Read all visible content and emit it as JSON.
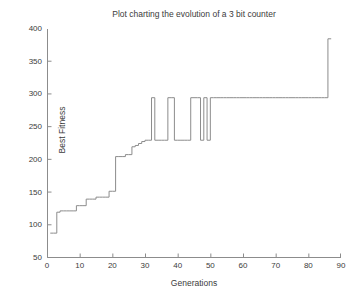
{
  "chart_data": {
    "type": "line",
    "title": "Plot charting the evolution of a 3 bit counter",
    "xlabel": "Generations",
    "ylabel": "Best Fitness",
    "xlim": [
      0,
      90
    ],
    "ylim": [
      50,
      400
    ],
    "xticks": [
      0,
      10,
      20,
      30,
      40,
      50,
      60,
      70,
      80,
      90
    ],
    "yticks": [
      50,
      100,
      150,
      200,
      250,
      300,
      350,
      400
    ],
    "grid": false,
    "legend": null,
    "line_color": "#8c8c8c",
    "background_color": "#ffffff",
    "drawstyle": "steps-post",
    "series": [
      {
        "name": "Best Fitness",
        "x": [
          1,
          2,
          3,
          4,
          5,
          6,
          7,
          8,
          9,
          10,
          11,
          12,
          13,
          14,
          15,
          16,
          17,
          18,
          19,
          20,
          21,
          22,
          23,
          24,
          25,
          26,
          27,
          28,
          29,
          30,
          31,
          32,
          33,
          34,
          35,
          36,
          37,
          38,
          39,
          40,
          41,
          42,
          43,
          44,
          45,
          46,
          47,
          48,
          49,
          50,
          51,
          52,
          53,
          54,
          55,
          56,
          57,
          58,
          59,
          60,
          61,
          62,
          63,
          64,
          65,
          66,
          67,
          68,
          69,
          70,
          71,
          72,
          73,
          74,
          75,
          76,
          77,
          78,
          79,
          80,
          81,
          82,
          83,
          84,
          85,
          86,
          87
        ],
        "y": [
          88,
          88,
          120,
          122,
          122,
          122,
          122,
          122,
          130,
          130,
          130,
          140,
          140,
          140,
          143,
          143,
          143,
          143,
          152,
          152,
          205,
          205,
          205,
          208,
          208,
          220,
          222,
          225,
          228,
          230,
          230,
          295,
          230,
          230,
          230,
          230,
          295,
          295,
          230,
          230,
          230,
          230,
          230,
          295,
          295,
          295,
          230,
          295,
          230,
          295,
          295,
          295,
          295,
          295,
          295,
          295,
          295,
          295,
          295,
          295,
          295,
          295,
          295,
          295,
          295,
          295,
          295,
          295,
          295,
          295,
          295,
          295,
          295,
          295,
          295,
          295,
          295,
          295,
          295,
          295,
          295,
          295,
          295,
          295,
          295,
          385,
          385
        ]
      }
    ],
    "annotations": [
      {
        "label": "initial fitness",
        "value": 88
      },
      {
        "label": "first plateau",
        "value": 230
      },
      {
        "label": "second plateau",
        "value": 295
      },
      {
        "label": "final fitness",
        "value": 385
      }
    ]
  },
  "axes": {
    "y_tick_labels": [
      "400",
      "350",
      "300",
      "250",
      "200",
      "150",
      "100",
      "50"
    ],
    "x_tick_labels": [
      "0",
      "10",
      "20",
      "30",
      "40",
      "50",
      "60",
      "70",
      "80",
      "90"
    ]
  }
}
